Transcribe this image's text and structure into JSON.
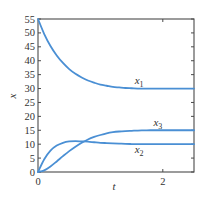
{
  "chart_data": {
    "type": "line",
    "title": "",
    "xlabel": "t",
    "ylabel": "x",
    "xlim": [
      0,
      2.5
    ],
    "ylim": [
      0,
      55
    ],
    "x_ticks": [
      0,
      2
    ],
    "x_tick_labels": [
      "0",
      "2"
    ],
    "y_ticks": [
      0,
      5,
      10,
      15,
      20,
      25,
      30,
      35,
      40,
      45,
      50,
      55
    ],
    "y_tick_labels": [
      "0",
      "5",
      "10",
      "15",
      "20",
      "25",
      "30",
      "35",
      "40",
      "45",
      "50",
      "55"
    ],
    "grid": false,
    "legend": "none (inline curve labels)",
    "line_color": "#4a8fd4",
    "x": [
      0,
      0.1,
      0.2,
      0.3,
      0.4,
      0.5,
      0.6,
      0.7,
      0.8,
      0.9,
      1.0,
      1.1,
      1.2,
      1.3,
      1.4,
      1.5,
      1.6,
      1.7,
      1.8,
      1.9,
      2.0,
      2.1,
      2.2,
      2.3,
      2.4,
      2.5
    ],
    "series": [
      {
        "name": "x1",
        "label": "x",
        "subscript": "1",
        "values": [
          55,
          49.6,
          45.3,
          41.9,
          39.2,
          37.0,
          35.3,
          34.0,
          32.9,
          32.1,
          31.4,
          31.0,
          30.6,
          30.4,
          30.2,
          30.1,
          30.0,
          30.0,
          30.0,
          30.0,
          30.0,
          30.0,
          30.0,
          30.0,
          30.0,
          30.0
        ],
        "label_at": [
          1.55,
          31.5
        ]
      },
      {
        "name": "x2",
        "label": "x",
        "subscript": "2",
        "values": [
          0,
          4.6,
          7.7,
          9.5,
          10.5,
          11.0,
          11.1,
          11.0,
          10.9,
          10.7,
          10.5,
          10.4,
          10.3,
          10.2,
          10.1,
          10.05,
          10.0,
          10.0,
          10.0,
          10.0,
          10.0,
          10.0,
          10.0,
          10.0,
          10.0,
          10.0
        ],
        "label_at": [
          1.55,
          7.0
        ]
      },
      {
        "name": "x3",
        "label": "x",
        "subscript": "3",
        "values": [
          0,
          0.6,
          2.0,
          3.8,
          5.7,
          7.5,
          9.1,
          10.5,
          11.7,
          12.6,
          13.3,
          13.9,
          14.3,
          14.55,
          14.7,
          14.8,
          14.9,
          14.95,
          15.0,
          15.0,
          15.0,
          15.0,
          15.0,
          15.0,
          15.0,
          15.0
        ],
        "label_at": [
          1.85,
          16.5
        ]
      }
    ]
  }
}
